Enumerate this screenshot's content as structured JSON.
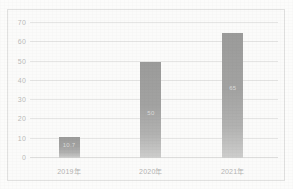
{
  "chart_data": {
    "type": "bar",
    "title": "",
    "xlabel": "",
    "ylabel": "",
    "categories": [
      "2019年",
      "2020年",
      "2021年"
    ],
    "values": [
      10.7,
      50,
      65
    ],
    "data_labels": [
      "10.7",
      "50",
      "65"
    ],
    "ylim": [
      0,
      70
    ],
    "yticks": [
      0,
      10,
      20,
      30,
      40,
      50,
      60,
      70
    ],
    "ytick_labels": [
      "0",
      "10",
      "20",
      "30",
      "40",
      "50",
      "60",
      "70"
    ],
    "grid": true,
    "legend": false,
    "bar_color": "#767676",
    "gridline_color": "#dcdcdc",
    "axis_text_color": "#9a9a9a",
    "border_color": "#d6d6d6",
    "background_color": "#ffffff"
  }
}
